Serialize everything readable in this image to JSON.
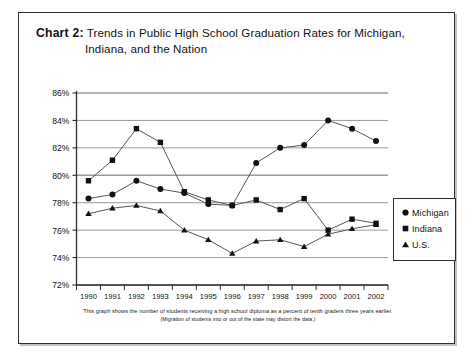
{
  "card": {
    "title_label": "Chart 2:",
    "title_line1": "Trends in Public High School Graduation Rates for Michigan,",
    "title_line2": "Indiana, and the Nation"
  },
  "footnote": {
    "line1": "This graph shows the number of students receiving a high school diploma as a percent of tenth graders three years earlier.",
    "line2": "(Migration of students into or out of the state may distort the data.)"
  },
  "legend": {
    "items": [
      {
        "label": "Michigan",
        "marker": "circle-marker-icon",
        "color": "#111111"
      },
      {
        "label": "Indiana",
        "marker": "square-marker-icon",
        "color": "#111111"
      },
      {
        "label": "U.S.",
        "marker": "triangle-marker-icon",
        "color": "#111111"
      }
    ]
  },
  "colors": {
    "line": "#555555",
    "marker": "#111111",
    "grid": "#9a9a9a",
    "axis": "#2b2b2b",
    "frame": "#2b2b2b",
    "background": "#ffffff"
  },
  "chart_data": {
    "type": "line",
    "title": "Chart 2: Trends in Public High School Graduation Rates for Michigan, Indiana, and the Nation",
    "xlabel": "",
    "ylabel": "",
    "x": [
      1990,
      1991,
      1992,
      1993,
      1994,
      1995,
      1996,
      1997,
      1998,
      1999,
      2000,
      2001,
      2002
    ],
    "categories": [
      "1990",
      "1991",
      "1992",
      "1993",
      "1994",
      "1995",
      "1996",
      "1997",
      "1998",
      "1999",
      "2000",
      "2001",
      "2002"
    ],
    "ylim": [
      72,
      86
    ],
    "yticks": [
      72,
      74,
      76,
      78,
      80,
      82,
      84,
      86
    ],
    "ytick_labels": [
      "72%",
      "74%",
      "76%",
      "78%",
      "80%",
      "82%",
      "84%",
      "86%"
    ],
    "grid": true,
    "legend_position": "right",
    "series": [
      {
        "name": "Michigan",
        "marker": "circle",
        "values": [
          78.3,
          78.6,
          79.6,
          79.0,
          78.7,
          77.9,
          77.8,
          80.9,
          82.0,
          82.2,
          84.0,
          83.4,
          82.5
        ]
      },
      {
        "name": "Indiana",
        "marker": "square",
        "values": [
          79.6,
          81.1,
          83.4,
          82.4,
          78.8,
          78.2,
          77.8,
          78.2,
          77.5,
          78.3,
          76.0,
          76.8,
          76.5
        ]
      },
      {
        "name": "U.S.",
        "marker": "triangle",
        "values": [
          77.2,
          77.6,
          77.8,
          77.4,
          76.0,
          75.3,
          74.3,
          75.2,
          75.3,
          74.8,
          75.7,
          76.1,
          76.4
        ]
      }
    ]
  }
}
